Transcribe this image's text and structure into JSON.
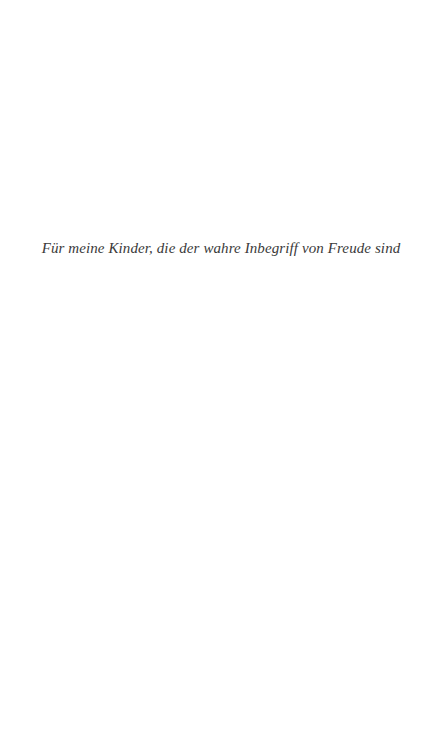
{
  "page": {
    "background": "#ffffff",
    "dedication": "Für meine Kinder, die der wahre Inbegriff von Freude sind",
    "text_color": "#3a3a3a"
  }
}
